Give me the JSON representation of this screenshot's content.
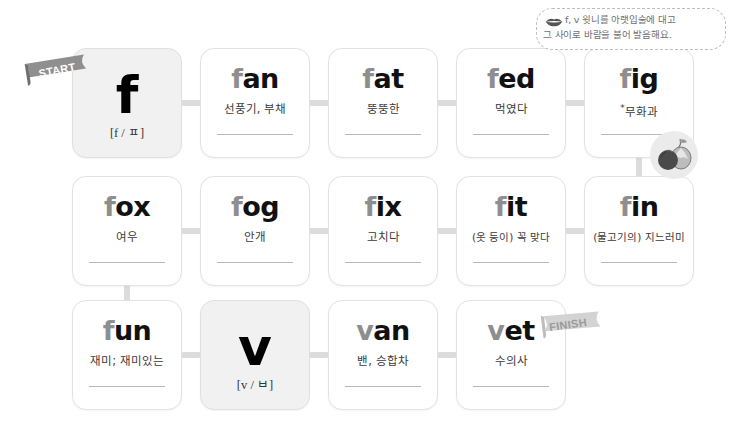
{
  "page": {
    "background": "#ffffff",
    "accent_gray": "#dcdcdc",
    "card_fill": "#ffffff",
    "letter_card_fill": "#f1f1f1"
  },
  "note": {
    "line1": "f, v 윗니를 아랫입술에 대고",
    "line2": "그 사이로 바람을 불어 발음해요.",
    "icon": "lips-icon"
  },
  "flags": {
    "start": "START",
    "finish": "FINISH"
  },
  "badges": {
    "fig": "fig-illustration"
  },
  "rows": [
    {
      "id": "row-1",
      "cards": [
        {
          "id": "card-f",
          "type": "letter",
          "word": "f",
          "head": "",
          "rest": "",
          "phonetic": "[f / ㅍ]",
          "meaning": "",
          "blank": false,
          "star": false
        },
        {
          "id": "card-fan",
          "type": "word",
          "word": "fan",
          "head": "f",
          "rest": "an",
          "phonetic": "",
          "meaning": "선풍기, 부채",
          "blank": true,
          "star": false
        },
        {
          "id": "card-fat",
          "type": "word",
          "word": "fat",
          "head": "f",
          "rest": "at",
          "phonetic": "",
          "meaning": "뚱뚱한",
          "blank": true,
          "star": false
        },
        {
          "id": "card-fed",
          "type": "word",
          "word": "fed",
          "head": "f",
          "rest": "ed",
          "phonetic": "",
          "meaning": "먹였다",
          "blank": true,
          "star": false
        },
        {
          "id": "card-fig",
          "type": "word",
          "word": "fig",
          "head": "f",
          "rest": "ig",
          "phonetic": "",
          "meaning": "무화과",
          "blank": true,
          "star": true
        }
      ]
    },
    {
      "id": "row-2",
      "cards": [
        {
          "id": "card-fox",
          "type": "word",
          "word": "fox",
          "head": "f",
          "rest": "ox",
          "phonetic": "",
          "meaning": "여우",
          "blank": true,
          "star": false
        },
        {
          "id": "card-fog",
          "type": "word",
          "word": "fog",
          "head": "f",
          "rest": "og",
          "phonetic": "",
          "meaning": "안개",
          "blank": true,
          "star": false
        },
        {
          "id": "card-fix",
          "type": "word",
          "word": "fix",
          "head": "f",
          "rest": "ix",
          "phonetic": "",
          "meaning": "고치다",
          "blank": true,
          "star": false
        },
        {
          "id": "card-fit",
          "type": "word",
          "word": "fit",
          "head": "f",
          "rest": "it",
          "phonetic": "",
          "meaning": "(옷 등이) 꼭 맞다",
          "blank": true,
          "star": false
        },
        {
          "id": "card-fin",
          "type": "word",
          "word": "fin",
          "head": "f",
          "rest": "in",
          "phonetic": "",
          "meaning": "(물고기의) 지느러미",
          "blank": true,
          "star": false
        }
      ]
    },
    {
      "id": "row-3",
      "cards": [
        {
          "id": "card-fun",
          "type": "word",
          "word": "fun",
          "head": "f",
          "rest": "un",
          "phonetic": "",
          "meaning": "재미; 재미있는",
          "blank": true,
          "star": false
        },
        {
          "id": "card-v",
          "type": "letter",
          "word": "v",
          "head": "",
          "rest": "",
          "phonetic": "[v / ㅂ]",
          "meaning": "",
          "blank": false,
          "star": false
        },
        {
          "id": "card-van",
          "type": "word",
          "word": "van",
          "head": "v",
          "rest": "an",
          "phonetic": "",
          "meaning": "밴, 승합차",
          "blank": true,
          "star": false
        },
        {
          "id": "card-vet",
          "type": "word",
          "word": "vet",
          "head": "v",
          "rest": "et",
          "phonetic": "",
          "meaning": "수의사",
          "blank": true,
          "star": false
        }
      ]
    }
  ]
}
